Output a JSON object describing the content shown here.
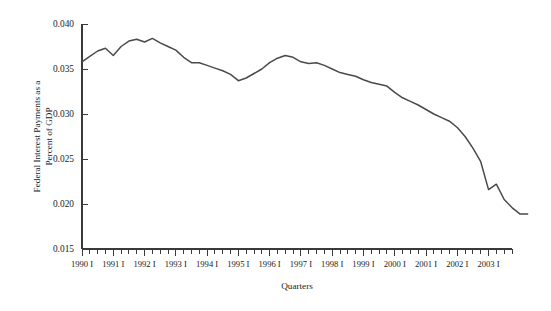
{
  "chart_data": {
    "type": "line",
    "title": "",
    "xlabel": "Quarters",
    "ylabel": "Federal Interest Payments as a Percent of GDP",
    "ylabel_line1": "Federal Interest Payments as a",
    "ylabel_line2": "Percent of GDP",
    "ylim": [
      0.015,
      0.04
    ],
    "ytick_values": [
      0.04,
      0.035,
      0.03,
      0.025,
      0.02,
      0.015
    ],
    "ytick_labels": [
      "0.040",
      "0.035",
      "0.030",
      "0.025",
      "0.020",
      "0.015"
    ],
    "grid": false,
    "legend": null,
    "line_color": "#4a4a4a",
    "line_width": 1.5,
    "x_major_labels": [
      "1990 I",
      "1991 I",
      "1992 I",
      "1993 I",
      "1994 I",
      "1995 I",
      "1996 I",
      "1997 I",
      "1998 I",
      "1999 I",
      "2000 I",
      "2001 I",
      "2002 I",
      "2003 I"
    ],
    "x_tick_count": 56,
    "x_minor_per_major": 4,
    "x": [
      "1990 I",
      "1990 II",
      "1990 III",
      "1990 IV",
      "1991 I",
      "1991 II",
      "1991 III",
      "1991 IV",
      "1992 I",
      "1992 II",
      "1992 III",
      "1992 IV",
      "1993 I",
      "1993 II",
      "1993 III",
      "1993 IV",
      "1994 I",
      "1994 II",
      "1994 III",
      "1994 IV",
      "1995 I",
      "1995 II",
      "1995 III",
      "1995 IV",
      "1996 I",
      "1996 II",
      "1996 III",
      "1996 IV",
      "1997 I",
      "1997 II",
      "1997 III",
      "1997 IV",
      "1998 I",
      "1998 II",
      "1998 III",
      "1998 IV",
      "1999 I",
      "1999 II",
      "1999 III",
      "1999 IV",
      "2000 I",
      "2000 II",
      "2000 III",
      "2000 IV",
      "2001 I",
      "2001 II",
      "2001 III",
      "2001 IV",
      "2002 I",
      "2002 II",
      "2002 III",
      "2002 IV",
      "2003 I",
      "2003 II",
      "2003 III"
    ],
    "values": [
      0.0358,
      0.0364,
      0.037,
      0.0373,
      0.0365,
      0.0375,
      0.0381,
      0.0383,
      0.038,
      0.0384,
      0.0379,
      0.0375,
      0.0371,
      0.0363,
      0.0357,
      0.0357,
      0.0354,
      0.0351,
      0.0348,
      0.0344,
      0.0337,
      0.034,
      0.0345,
      0.035,
      0.0357,
      0.0362,
      0.0365,
      0.0363,
      0.0358,
      0.0356,
      0.0357,
      0.0354,
      0.035,
      0.0346,
      0.0344,
      0.0342,
      0.0338,
      0.0335,
      0.0333,
      0.0331,
      0.0324,
      0.0318,
      0.0314,
      0.031,
      0.0305,
      0.03,
      0.0296,
      0.0292,
      0.0285,
      0.0275,
      0.0262,
      0.0247,
      0.0216,
      0.0222,
      0.0205
    ],
    "value_end_flat": [
      0.0196,
      0.0189,
      0.0189
    ]
  },
  "axis": {
    "y_axis_name": "y-axis",
    "x_axis_name": "x-axis"
  }
}
